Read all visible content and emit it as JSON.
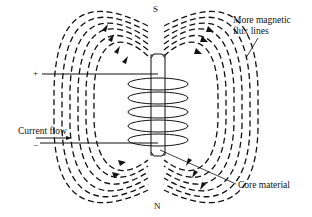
{
  "diagram": {
    "type": "electromagnet-solenoid",
    "colors": {
      "ink": "#111111",
      "background": "#ffffff"
    },
    "poles": {
      "top": "S",
      "bottom": "N"
    },
    "terminals": {
      "positive": "+",
      "negative": "−"
    },
    "labels": {
      "flux": [
        "More magnetic",
        "flux lines"
      ],
      "current": "Current flow",
      "core": "Core material"
    },
    "coil_turns": 5,
    "flux_line_count": 6
  }
}
